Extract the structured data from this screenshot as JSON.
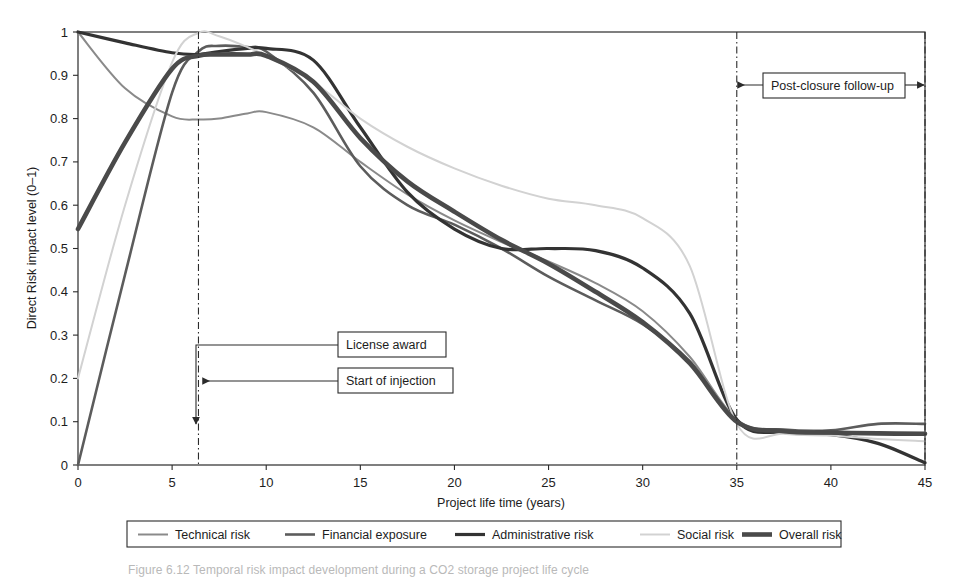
{
  "figure": {
    "caption": "Figure 6.12 Temporal risk impact development during a CO2 storage project life cycle"
  },
  "axes": {
    "x": {
      "label": "Project life time (years)",
      "ticks": [
        0,
        5,
        10,
        15,
        20,
        25,
        30,
        35,
        40,
        45
      ],
      "min": 0,
      "max": 45
    },
    "y": {
      "label": "Direct Risk impact level (0–1)",
      "ticks": [
        "0",
        "0.1",
        "0.2",
        "0.3",
        "0.4",
        "0.5",
        "0.6",
        "0.7",
        "0.8",
        "0.9",
        "1"
      ],
      "min": 0,
      "max": 1
    }
  },
  "annotations": [
    {
      "name": "license-award",
      "label": "License award",
      "x_marker": 5
    },
    {
      "name": "start-of-injection",
      "label": "Start of injection",
      "x_marker": 6.4
    },
    {
      "name": "post-closure-follow-up",
      "label": "Post-closure follow-up",
      "x_from": 35,
      "x_to": 45
    }
  ],
  "markers": {
    "start_of_injection_x": 6.4,
    "closure_x": 35
  },
  "legend": {
    "items": [
      {
        "label": "Technical risk",
        "color": "#8a8a8a",
        "width": 2.0
      },
      {
        "label": "Financial exposure",
        "color": "#5c5c5c",
        "width": 2.6
      },
      {
        "label": "Administrative risk",
        "color": "#333333",
        "width": 3.2
      },
      {
        "label": "Social risk",
        "color": "#d2d2d2",
        "width": 2.0
      },
      {
        "label": "Overall risk",
        "color": "#4a4a4a",
        "width": 4.6
      }
    ]
  },
  "chart_data": {
    "type": "line",
    "title": "",
    "xlabel": "Project life time (years)",
    "ylabel": "Direct Risk impact level (0–1)",
    "xlim": [
      0,
      45
    ],
    "ylim": [
      0,
      1
    ],
    "grid": false,
    "legend_position": "bottom",
    "x": [
      0,
      2.5,
      5,
      6.4,
      7.5,
      9,
      10,
      12.5,
      15,
      17.5,
      20,
      22.5,
      25,
      27.5,
      30,
      32.5,
      35,
      37.5,
      40,
      42.5,
      45
    ],
    "series": [
      {
        "name": "Technical risk",
        "color": "#8a8a8a",
        "values": [
          1.0,
          0.87,
          0.805,
          0.798,
          0.8,
          0.812,
          0.815,
          0.78,
          0.7,
          0.625,
          0.565,
          0.515,
          0.47,
          0.42,
          0.355,
          0.25,
          0.105,
          0.075,
          0.073,
          0.072,
          0.07
        ]
      },
      {
        "name": "Financial exposure",
        "color": "#5c5c5c",
        "values": [
          0.0,
          0.44,
          0.86,
          0.955,
          0.968,
          0.965,
          0.955,
          0.86,
          0.69,
          0.6,
          0.555,
          0.5,
          0.435,
          0.38,
          0.325,
          0.24,
          0.1,
          0.082,
          0.08,
          0.095,
          0.095
        ]
      },
      {
        "name": "Administrative risk",
        "color": "#333333",
        "values": [
          1.0,
          0.975,
          0.952,
          0.948,
          0.955,
          0.962,
          0.962,
          0.935,
          0.78,
          0.63,
          0.545,
          0.5,
          0.5,
          0.495,
          0.455,
          0.35,
          0.105,
          0.075,
          0.07,
          0.05,
          0.005
        ]
      },
      {
        "name": "Social risk",
        "color": "#d2d2d2",
        "values": [
          0.2,
          0.6,
          0.93,
          0.998,
          0.99,
          0.965,
          0.945,
          0.885,
          0.8,
          0.735,
          0.685,
          0.645,
          0.615,
          0.6,
          0.57,
          0.46,
          0.095,
          0.072,
          0.068,
          0.06,
          0.055
        ]
      },
      {
        "name": "Overall risk",
        "color": "#4a4a4a",
        "values": [
          0.545,
          0.745,
          0.915,
          0.945,
          0.948,
          0.948,
          0.945,
          0.885,
          0.755,
          0.655,
          0.585,
          0.52,
          0.465,
          0.4,
          0.33,
          0.235,
          0.1,
          0.078,
          0.075,
          0.073,
          0.072
        ]
      }
    ]
  }
}
